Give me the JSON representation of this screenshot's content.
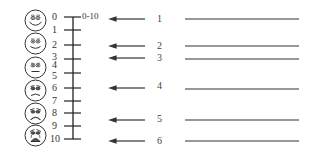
{
  "diagram": {
    "type": "pain-rating-scale",
    "faces": [
      {
        "id": "face-1",
        "expression": "very-happy",
        "cy": 20
      },
      {
        "id": "face-2",
        "expression": "happy",
        "cy": 43
      },
      {
        "id": "face-3",
        "expression": "neutral",
        "cy": 67
      },
      {
        "id": "face-4",
        "expression": "sad",
        "cy": 90
      },
      {
        "id": "face-5",
        "expression": "very-sad",
        "cy": 113
      },
      {
        "id": "face-6",
        "expression": "crying",
        "cy": 135
      }
    ],
    "scale": {
      "range_label": "0-10",
      "ticks": [
        {
          "label": "0",
          "y": 17
        },
        {
          "label": "1",
          "y": 30
        },
        {
          "label": "2",
          "y": 45
        },
        {
          "label": "3",
          "y": 57
        },
        {
          "label": "4",
          "y": 64
        },
        {
          "label": "5",
          "y": 74
        },
        {
          "label": "6",
          "y": 88
        },
        {
          "label": "7",
          "y": 101
        },
        {
          "label": "8",
          "y": 113
        },
        {
          "label": "9",
          "y": 126
        },
        {
          "label": "10",
          "y": 139
        }
      ]
    },
    "arrows": [
      {
        "label": "1",
        "y": 19
      },
      {
        "label": "2",
        "y": 46
      },
      {
        "label": "3",
        "y": 58
      },
      {
        "label": "4",
        "y": 88
      },
      {
        "label": "5",
        "y": 120
      },
      {
        "label": "6",
        "y": 141
      }
    ],
    "colors": {
      "ink": "#222222",
      "background": "#ffffff"
    }
  }
}
